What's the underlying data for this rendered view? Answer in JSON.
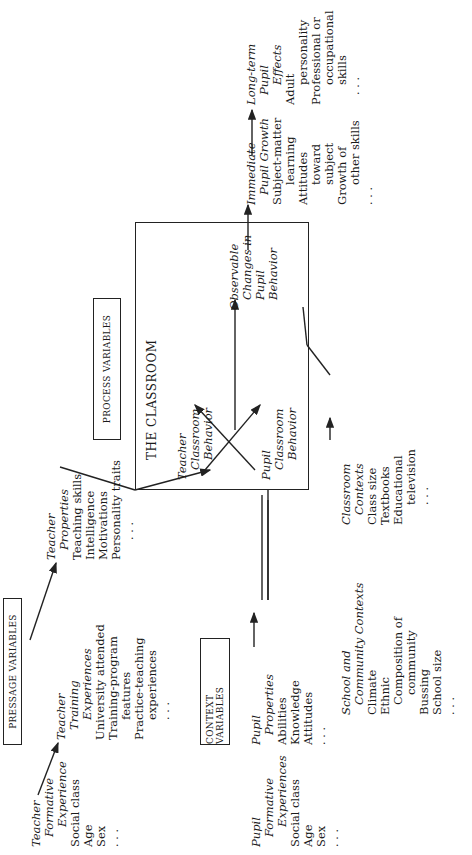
{
  "labels": {
    "pressage": "PRESSAGE VARIABLES",
    "process": "PROCESS VARIABLES",
    "context": "CONTEXT VARIABLES",
    "classroom": "THE CLASSROOM"
  },
  "teacher_formative": {
    "title": [
      "Teacher",
      "Formative",
      "Experience"
    ],
    "items": [
      "Social class",
      "Age",
      "Sex",
      ". . ."
    ]
  },
  "teacher_training": {
    "title": [
      "Teacher",
      "Training",
      "Experiences"
    ],
    "items": [
      "University attended",
      "Training-program",
      "features",
      "Practice-teaching",
      "experiences",
      ". . ."
    ]
  },
  "teacher_properties": {
    "title": [
      "Teacher",
      "Properties"
    ],
    "items": [
      "Teaching skills",
      "Intelligence",
      "Motivations",
      "Personality traits",
      ". . ."
    ]
  },
  "pupil_formative": {
    "title": [
      "Pupil",
      "Formative",
      "Experiences"
    ],
    "items": [
      "Social class",
      "Age",
      "Sex",
      ". . ."
    ]
  },
  "pupil_properties": {
    "title": [
      "Pupil",
      "Properties"
    ],
    "items": [
      "Abilities",
      "Knowledge",
      "Attitudes",
      ". . ."
    ]
  },
  "school_community": {
    "title": [
      "School and",
      "Community Contexts"
    ],
    "items": [
      "Climate",
      "Ethnic",
      "Composition of",
      "community",
      "Bussing",
      "School size",
      ". . ."
    ]
  },
  "classroom_contexts": {
    "title": [
      "Classroom",
      "Contexts"
    ],
    "items": [
      "Class size",
      "Textbooks",
      "Educational",
      "television",
      ". . ."
    ]
  },
  "teacher_behavior": {
    "title": [
      "Teacher",
      "Classroom",
      "Behavior"
    ]
  },
  "pupil_behavior": {
    "title": [
      "Pupil",
      "Classroom",
      "Behavior"
    ]
  },
  "observable_changes": {
    "title": [
      "Observable",
      "Changes in",
      "Pupil",
      "Behavior"
    ]
  },
  "immediate_growth": {
    "title": [
      "Immediate",
      "Pupil Growth"
    ],
    "items": [
      "Subject-matter",
      "learning",
      "Attitudes",
      "toward",
      "subject",
      "Growth of",
      "other skills",
      ". . ."
    ]
  },
  "longterm_effects": {
    "title": [
      "Long-term",
      "Pupil",
      "Effects"
    ],
    "items": [
      "Adult",
      "personality",
      "Professional or",
      "occupational",
      "skills",
      ". . ."
    ]
  }
}
